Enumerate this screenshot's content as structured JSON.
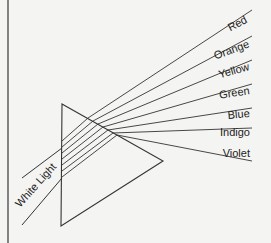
{
  "diagram": {
    "title": "",
    "incoming_label": "White Light",
    "spectrum": [
      {
        "label": "Red",
        "y_end": 10
      },
      {
        "label": "Orange",
        "y_end": 36
      },
      {
        "label": "Yellow",
        "y_end": 60
      },
      {
        "label": "Green",
        "y_end": 84
      },
      {
        "label": "Blue",
        "y_end": 108
      },
      {
        "label": "Indigo",
        "y_end": 128
      },
      {
        "label": "Violet",
        "y_end": 161
      }
    ],
    "colors": {
      "line": "#333333",
      "background": "#f4f4f2"
    }
  }
}
